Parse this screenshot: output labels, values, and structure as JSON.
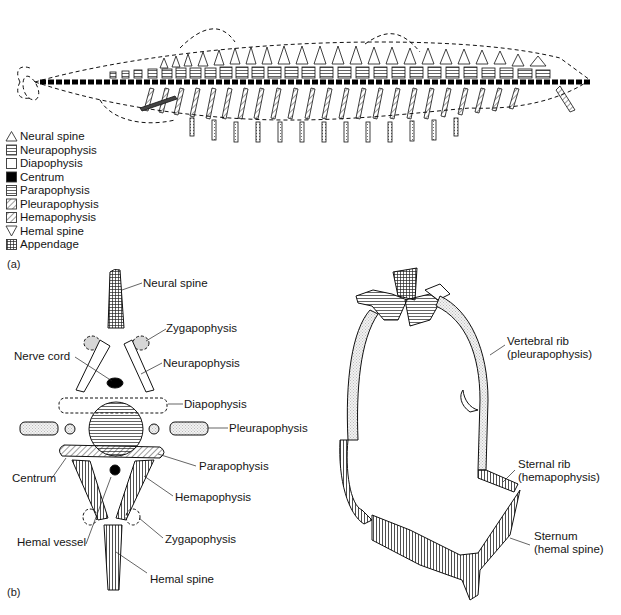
{
  "figure": {
    "panel_a": {
      "tag": "(a)",
      "subject": "fish skeleton with vertebral elements shaded by type",
      "legend": [
        {
          "symbol": "triangle-up-outline",
          "label": "Neural spine"
        },
        {
          "symbol": "horizontal-lines",
          "label": "Neurapophysis"
        },
        {
          "symbol": "open-square",
          "label": "Diapophysis"
        },
        {
          "symbol": "solid-black",
          "label": "Centrum"
        },
        {
          "symbol": "fine-horizontal-lines",
          "label": "Parapophysis"
        },
        {
          "symbol": "diagonal-hatch",
          "label": "Pleurapophysis"
        },
        {
          "symbol": "dense-diagonal-hatch",
          "label": "Hemapophysis"
        },
        {
          "symbol": "triangle-down-outline",
          "label": "Hemal spine"
        },
        {
          "symbol": "dark-crosshatch",
          "label": "Appendage"
        }
      ]
    },
    "panel_b": {
      "tag": "(b)",
      "labels": {
        "neural_spine": "Neural spine",
        "zygapophysis_top": "Zygapophysis",
        "nerve_cord": "Nerve cord",
        "neurapophysis": "Neurapophysis",
        "diapophysis": "Diapophysis",
        "pleurapophysis": "Pleurapophysis",
        "centrum": "Centrum",
        "parapophysis": "Parapophysis",
        "hemapophysis": "Hemapophysis",
        "hemal_vessel": "Hemal vessel",
        "zygapophysis_bottom": "Zygapophysis",
        "hemal_spine": "Hemal spine"
      }
    },
    "panel_c": {
      "labels": {
        "vertebral_rib": "Vertebral rib",
        "vertebral_rib_sub": "(pleurapophysis)",
        "sternal_rib": "Sternal rib",
        "sternal_rib_sub": "(hemapophysis)",
        "sternum": "Sternum",
        "sternum_sub": "(hemal spine)"
      }
    },
    "colors": {
      "ink": "#151515",
      "background": "#ffffff"
    }
  }
}
